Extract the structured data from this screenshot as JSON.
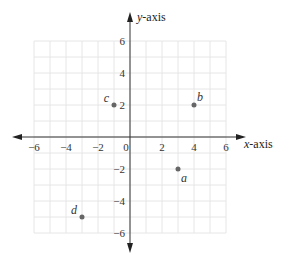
{
  "chart_data": {
    "type": "scatter",
    "title": "",
    "xlabel": "x-axis",
    "ylabel": "y-axis",
    "xlim": [
      -6,
      6
    ],
    "ylim": [
      -6,
      6
    ],
    "grid": true,
    "grid_step": 1,
    "x_ticks": [
      -6,
      -4,
      -2,
      0,
      2,
      4,
      6
    ],
    "y_ticks": [
      -6,
      -4,
      -2,
      2,
      4,
      6
    ],
    "x_tick_labels": [
      "−6",
      "−4",
      "−2",
      "0",
      "2",
      "4",
      "6"
    ],
    "y_tick_labels": [
      "−6",
      "−4",
      "−2",
      "2",
      "4",
      "6"
    ],
    "points": [
      {
        "label": "a",
        "x": 3,
        "y": -2
      },
      {
        "label": "b",
        "x": 4,
        "y": 2
      },
      {
        "label": "c",
        "x": -1,
        "y": 2
      },
      {
        "label": "d",
        "x": -3,
        "y": -5
      }
    ],
    "colors": {
      "axis": "#333333",
      "grid": "#e6e6e6",
      "point": "#666666"
    }
  }
}
